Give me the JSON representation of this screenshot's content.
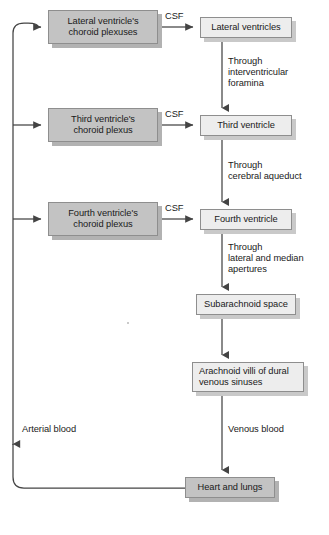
{
  "diagram": {
    "colors": {
      "node_light_fill": "#ededed",
      "node_dark_fill": "#c3c3c3",
      "node_border": "#8e8e8e",
      "shadow_light": "#c9c9c9",
      "shadow_dark": "#b2b2b2",
      "line": "#444444",
      "text": "#1a1a1a",
      "background": "#ffffff"
    },
    "nodes": [
      {
        "id": "lateral-choroid",
        "label": "Lateral ventricle's\nchoroid plexuses",
        "style": "dark",
        "x": 48,
        "y": 10,
        "w": 110,
        "h": 34
      },
      {
        "id": "lateral-ventricles",
        "label": "Lateral ventricles",
        "style": "light",
        "x": 200,
        "y": 17,
        "w": 92,
        "h": 21
      },
      {
        "id": "third-choroid",
        "label": "Third ventricle's\nchoroid plexus",
        "style": "dark",
        "x": 48,
        "y": 108,
        "w": 110,
        "h": 34
      },
      {
        "id": "third-ventricle",
        "label": "Third ventricle",
        "style": "light",
        "x": 200,
        "y": 115,
        "w": 92,
        "h": 21
      },
      {
        "id": "fourth-choroid",
        "label": "Fourth ventricle's\nchoroid plexus",
        "style": "dark",
        "x": 48,
        "y": 202,
        "w": 110,
        "h": 34
      },
      {
        "id": "fourth-ventricle",
        "label": "Fourth ventricle",
        "style": "light",
        "x": 200,
        "y": 209,
        "w": 92,
        "h": 21
      },
      {
        "id": "subarachnoid",
        "label": "Subarachnoid space",
        "style": "light",
        "x": 196,
        "y": 294,
        "w": 100,
        "h": 21
      },
      {
        "id": "arachnoid-villi",
        "label": "Arachnoid villi of dural\nvenous sinuses",
        "style": "light",
        "x": 192,
        "y": 362,
        "w": 112,
        "h": 30
      },
      {
        "id": "heart-lungs",
        "label": "Heart and lungs",
        "style": "dark",
        "x": 185,
        "y": 477,
        "w": 90,
        "h": 21
      }
    ],
    "edge_labels": [
      {
        "id": "csf-1",
        "text": "CSF",
        "x": 165,
        "y": 11,
        "align": "left"
      },
      {
        "id": "csf-2",
        "text": "CSF",
        "x": 165,
        "y": 109,
        "align": "left"
      },
      {
        "id": "csf-3",
        "text": "CSF",
        "x": 165,
        "y": 203,
        "align": "left"
      },
      {
        "id": "through-interventricular-foramina",
        "text": "Through\ninterventricular\nforamina",
        "x": 228,
        "y": 56,
        "align": "left"
      },
      {
        "id": "through-cerebral-aqueduct",
        "text": "Through\ncerebral aqueduct",
        "x": 228,
        "y": 160,
        "align": "left"
      },
      {
        "id": "through-lateral-and-median-apertures",
        "text": "Through\nlateral and median\napertures",
        "x": 228,
        "y": 242,
        "align": "left"
      },
      {
        "id": "venous-blood",
        "text": "Venous blood",
        "x": 228,
        "y": 424,
        "align": "left"
      },
      {
        "id": "arterial-blood",
        "text": "Arterial blood",
        "x": 22,
        "y": 424,
        "align": "left"
      }
    ],
    "edges": [
      {
        "id": "lateral-choroid-to-lateral-ventricles",
        "kind": "csf-arrow"
      },
      {
        "id": "lateral-ventricles-to-third-ventricle",
        "kind": "vertical-arrow"
      },
      {
        "id": "third-choroid-to-third-ventricle",
        "kind": "csf-arrow"
      },
      {
        "id": "third-ventricle-to-fourth-ventricle",
        "kind": "vertical-arrow"
      },
      {
        "id": "fourth-choroid-to-fourth-ventricle",
        "kind": "csf-arrow"
      },
      {
        "id": "fourth-ventricle-to-subarachnoid",
        "kind": "vertical-arrow"
      },
      {
        "id": "subarachnoid-to-arachnoid-villi",
        "kind": "vertical-arrow"
      },
      {
        "id": "arachnoid-villi-to-heart-lungs",
        "kind": "vertical-arrow"
      },
      {
        "id": "heart-lungs-to-choroid-plexuses",
        "kind": "return-loop"
      }
    ]
  }
}
